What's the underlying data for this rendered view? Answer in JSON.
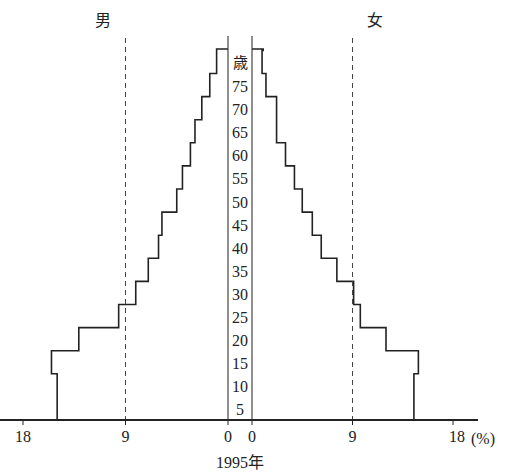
{
  "chart_data": {
    "type": "bar",
    "subtype": "population-pyramid",
    "title": "1995年",
    "left_label": "男",
    "right_label": "女",
    "center_axis_label": "歳",
    "x_unit": "(%)",
    "x_ticks_left": [
      "18",
      "9",
      "0"
    ],
    "x_ticks_right": [
      "0",
      "9",
      "18"
    ],
    "x_tick_values": [
      0,
      9,
      18
    ],
    "reference_lines": [
      9
    ],
    "xlim": [
      0,
      18
    ],
    "age_labels": [
      "75",
      "70",
      "65",
      "60",
      "55",
      "50",
      "45",
      "40",
      "35",
      "30",
      "25",
      "20",
      "15",
      "10",
      "5"
    ],
    "categories": [
      "0-4",
      "5-9",
      "10-14",
      "15-19",
      "20-24",
      "25-29",
      "30-34",
      "35-39",
      "40-44",
      "45-49",
      "50-54",
      "55-59",
      "60-64",
      "65-69",
      "70-74",
      "75-79",
      "80+"
    ],
    "series": [
      {
        "name": "男",
        "side": "left",
        "values": [
          15.0,
          15.0,
          15.5,
          13.1,
          9.6,
          8.1,
          7.0,
          6.1,
          5.8,
          4.5,
          4.0,
          3.3,
          2.9,
          2.3,
          1.6,
          1.0,
          1.0
        ]
      },
      {
        "name": "女",
        "side": "right",
        "values": [
          14.5,
          14.5,
          14.9,
          12.0,
          9.7,
          9.1,
          7.6,
          6.2,
          5.4,
          4.5,
          3.8,
          3.0,
          2.2,
          2.2,
          1.25,
          0.9,
          1.0
        ]
      }
    ],
    "grid": false,
    "legend": "none"
  }
}
